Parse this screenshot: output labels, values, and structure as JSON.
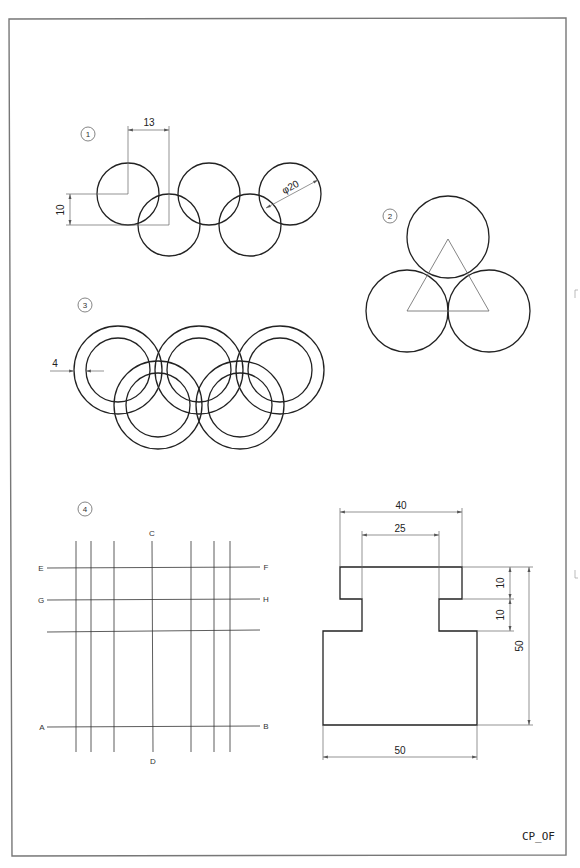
{
  "sheet": {
    "title_block": "CP_OF"
  },
  "figures": [
    {
      "number": "1",
      "description": "Five interlocking circles",
      "dimensions": {
        "horizontal_offset": "13",
        "vertical_offset": "10",
        "diameter": "φ20"
      }
    },
    {
      "number": "2",
      "description": "Three tangent circles with triangle through centers"
    },
    {
      "number": "3",
      "description": "Five interlocking rings",
      "dimensions": {
        "ring_thickness": "4"
      }
    },
    {
      "number": "4",
      "description": "Grid of lines",
      "labels": {
        "top": "C",
        "bottom": "D",
        "row1_left": "E",
        "row1_right": "F",
        "row2_left": "G",
        "row2_right": "H",
        "row4_left": "A",
        "row4_right": "B"
      }
    },
    {
      "description": "Stepped part profile",
      "dimensions": {
        "top_width": "40",
        "neck_width": "25",
        "base_width": "50",
        "top_height": "10",
        "neck_height": "10",
        "total_height": "50"
      }
    }
  ]
}
